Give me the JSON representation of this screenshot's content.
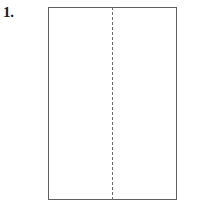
{
  "figure": {
    "step_label": "1.",
    "title": "Fold paper in half lengthwise",
    "paper": {
      "name": "rectangular sheet of paper",
      "border_color": "#5f5f5f",
      "fill_color": "#ffffff"
    },
    "fold": {
      "name": "vertical dashed fold line",
      "orientation": "vertical",
      "style": "dashed",
      "color": "#6a6a6a",
      "position_label": "center"
    },
    "background_color": "#ffffff"
  }
}
